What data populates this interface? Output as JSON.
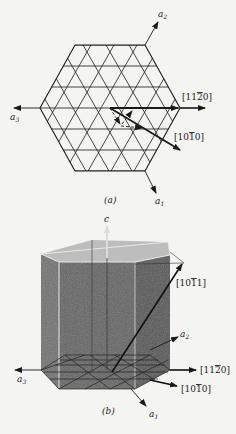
{
  "figure": {
    "panel_a": {
      "caption": "(a)",
      "axes": {
        "a1": {
          "base": "a",
          "sub": "1"
        },
        "a2": {
          "base": "a",
          "sub": "2"
        },
        "a3": {
          "base": "a",
          "sub": "3"
        }
      },
      "directions": {
        "d1120": {
          "pre": "[11",
          "bar": "2",
          "post": "0]"
        },
        "d1010": {
          "pre": "[10",
          "bar": "1",
          "post": "0]"
        }
      }
    },
    "panel_b": {
      "caption": "(b)",
      "axes": {
        "c": "c",
        "a1": {
          "base": "a",
          "sub": "1"
        },
        "a2": {
          "base": "a",
          "sub": "2"
        },
        "a3": {
          "base": "a",
          "sub": "3"
        }
      },
      "directions": {
        "d1011": {
          "pre": "[10",
          "bar": "1",
          "post": "1]"
        },
        "d1120": {
          "pre": "[11",
          "bar": "2",
          "post": "0]"
        },
        "d1010": {
          "pre": "[10",
          "bar": "1",
          "post": "0]"
        }
      }
    },
    "colors": {
      "ink": "#1a1a1a",
      "paper": "#f4f4f2",
      "prism_front": "#6a6a6a",
      "prism_side": "#575757",
      "prism_top": "#bdbdbd"
    }
  }
}
